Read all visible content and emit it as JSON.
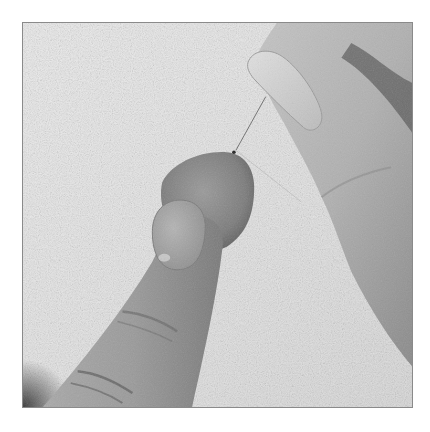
{
  "image": {
    "description": "Black and white photograph: fingers hold a small round fabric ball against textured linen while the other hand pulls a threaded needle out from the top of the ball",
    "palette": {
      "background": "#ffffff",
      "fabric": "#e6e6e6",
      "skin_light": "#c8c8c8",
      "skin_mid": "#9e9e9e",
      "skin_dark": "#5a5a5a",
      "ball": "#8c8c8c",
      "frame_border": "#8a8a8a"
    }
  }
}
